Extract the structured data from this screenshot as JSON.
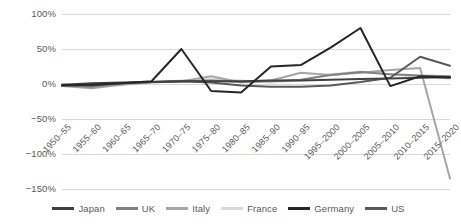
{
  "chart_data": {
    "type": "line",
    "title": "",
    "subtitle": "",
    "xlabel": "",
    "ylabel": "",
    "grid": true,
    "legend_position": "bottom",
    "ylim": [
      -150,
      100
    ],
    "y_ticks": [
      100,
      50,
      0,
      -50,
      -100,
      -150
    ],
    "y_tick_labels": [
      "100%",
      "50%",
      "0%",
      "−50%",
      "−100%",
      "−150%"
    ],
    "categories": [
      "1950–55",
      "1955–60",
      "1960–65",
      "1965–70",
      "1970–75",
      "1975–80",
      "1980–85",
      "1985–90",
      "1990–95",
      "1995–2000",
      "2000–2005",
      "2005–2010",
      "2010–2015",
      "2015–2020"
    ],
    "series": [
      {
        "name": "Japan",
        "color": "#404040",
        "values": [
          -1,
          1,
          2,
          3,
          4,
          4,
          4,
          5,
          5,
          6,
          7,
          8,
          9,
          10
        ]
      },
      {
        "name": "UK",
        "color": "#808080",
        "values": [
          -2,
          -4,
          1,
          3,
          4,
          5,
          3,
          4,
          6,
          13,
          17,
          14,
          12,
          11
        ]
      },
      {
        "name": "Italy",
        "color": "#a6a6a6",
        "values": [
          -3,
          -6,
          -1,
          2,
          4,
          11,
          2,
          5,
          16,
          13,
          16,
          20,
          23,
          -135
        ]
      },
      {
        "name": "France",
        "color": "#d9d9d9",
        "values": [
          -2,
          -3,
          0,
          3,
          5,
          7,
          5,
          2,
          5,
          14,
          18,
          14,
          10,
          8
        ]
      },
      {
        "name": "Germany",
        "color": "#262626",
        "values": [
          -2,
          -1,
          1,
          4,
          50,
          -10,
          -12,
          25,
          27,
          52,
          80,
          -3,
          11,
          9
        ]
      },
      {
        "name": "US",
        "color": "#595959",
        "values": [
          -1,
          -2,
          1,
          3,
          4,
          2,
          -2,
          -4,
          -4,
          -2,
          3,
          9,
          39,
          26
        ]
      }
    ]
  },
  "legend": {
    "items": [
      {
        "label": "Japan",
        "color": "#404040"
      },
      {
        "label": "UK",
        "color": "#808080"
      },
      {
        "label": "Italy",
        "color": "#a6a6a6"
      },
      {
        "label": "France",
        "color": "#d9d9d9"
      },
      {
        "label": "Germany",
        "color": "#262626"
      },
      {
        "label": "US",
        "color": "#595959"
      }
    ]
  },
  "colors": {
    "gridline": "#d9d9d9",
    "text": "#595959",
    "background": "#ffffff"
  }
}
